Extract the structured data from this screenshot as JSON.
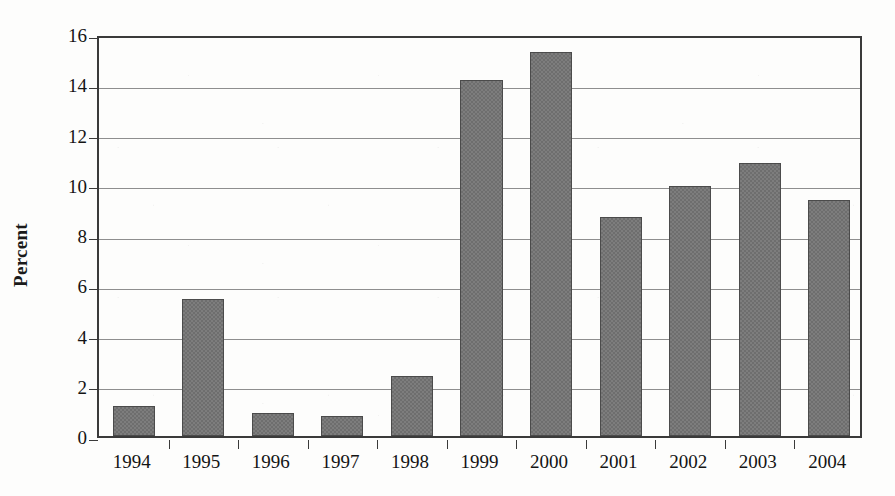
{
  "chart_data": {
    "type": "bar",
    "title": "",
    "xlabel": "",
    "ylabel": "Percent",
    "categories": [
      "1994",
      "1995",
      "1996",
      "1997",
      "1998",
      "1999",
      "2000",
      "2001",
      "2002",
      "2003",
      "2004"
    ],
    "values": [
      1.2,
      5.45,
      0.9,
      0.78,
      2.4,
      14.15,
      15.3,
      8.7,
      9.95,
      10.85,
      9.4
    ],
    "ylim": [
      0,
      16
    ],
    "ytick_values": [
      0,
      2,
      4,
      6,
      8,
      10,
      12,
      14,
      16
    ],
    "ytick_labels": [
      "0",
      "2",
      "4",
      "6",
      "8",
      "10",
      "12",
      "14",
      "16"
    ],
    "grid": "horizontal",
    "legend": "none",
    "bar_color": "#7d7d7d",
    "bar_edge_color": "#4b4b4b",
    "gridline_color": "#8e8e8e",
    "axis_color": "#3a3a3a",
    "background_color": "#fdfdfc"
  }
}
